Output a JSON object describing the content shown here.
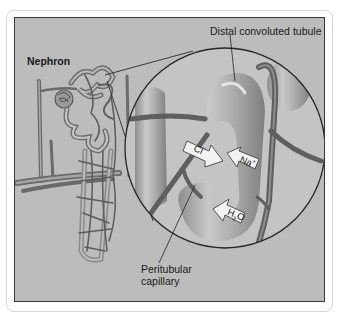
{
  "figure": {
    "title": "Nephron",
    "labels": {
      "distal_tubule": "Distal convoluted tubule",
      "capillary_line1": "Peritubular",
      "capillary_line2": "capillary"
    },
    "ions": [
      {
        "name": "chloride",
        "symbol": "Cl",
        "charge": "-",
        "direction": "into capillary"
      },
      {
        "name": "sodium",
        "symbol": "Na",
        "charge": "+",
        "direction": "into capillary"
      },
      {
        "name": "water",
        "symbol": "H",
        "subscript": "2",
        "suffix": "O",
        "direction": "into capillary"
      }
    ],
    "colors": {
      "background": "#bcbcbc",
      "circle_fill": "#c4c4c4",
      "tubule": "#a9a9a9",
      "capillary": "#6e6e6e",
      "border": "#3a3a3a",
      "arrow_fill": "#f2f2f2"
    }
  }
}
